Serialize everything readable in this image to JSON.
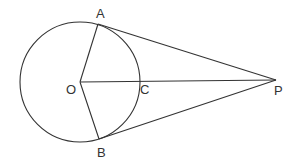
{
  "diagram": {
    "stroke_color": "#333333",
    "circle": {
      "center": "O",
      "cx": 80,
      "cy": 82,
      "r": 60
    },
    "points": {
      "O": {
        "label": "O",
        "x": 80,
        "y": 82
      },
      "A": {
        "label": "A",
        "x": 98,
        "y": 24
      },
      "B": {
        "label": "B",
        "x": 99,
        "y": 139
      },
      "C": {
        "label": "C",
        "x": 140,
        "y": 81
      },
      "P": {
        "label": "P",
        "x": 276,
        "y": 80
      }
    },
    "segments": [
      "OA",
      "OB",
      "OP",
      "AP",
      "BP"
    ]
  }
}
